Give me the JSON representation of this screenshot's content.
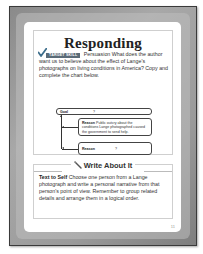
{
  "page": {
    "number": "11"
  },
  "responding": {
    "title": "Responding",
    "badge": "TARGET SKILL",
    "skill": "Persuasion",
    "question": " What does the author want us to believe about the effect of Lange's photographs on living conditions in America? Copy and complete the chart below."
  },
  "chart": {
    "goal_label": "Goal",
    "goal_value": "?",
    "reasons": [
      {
        "label": "Reason",
        "text": " Public outcry about the conditions Lange photographed caused the government to send help."
      },
      {
        "label": "Reason",
        "text": "?"
      }
    ]
  },
  "write_about_it": {
    "title": "Write About It",
    "lead": "Text to Self",
    "text": " Choose one person from a Lange photograph and write a personal narrative from that person's point of view. Remember to group related details and arrange them in a logical order."
  },
  "colors": {
    "frame": "#9a9a9a",
    "badge": "#5a6b78",
    "check": "#3d6e8c",
    "text": "#333333"
  }
}
